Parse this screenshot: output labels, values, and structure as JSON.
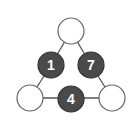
{
  "puzzle": {
    "type": "triangle-number-puzzle",
    "nodes": [
      {
        "id": "top",
        "value": ""
      },
      {
        "id": "left-middle",
        "value": "1"
      },
      {
        "id": "right-middle",
        "value": "7"
      },
      {
        "id": "bottom-left",
        "value": ""
      },
      {
        "id": "bottom-middle",
        "value": "4"
      },
      {
        "id": "bottom-right",
        "value": ""
      }
    ],
    "colors": {
      "filled": "#4a4a4a",
      "empty": "#ffffff",
      "line": "#555555",
      "text": "#ffffff"
    }
  }
}
